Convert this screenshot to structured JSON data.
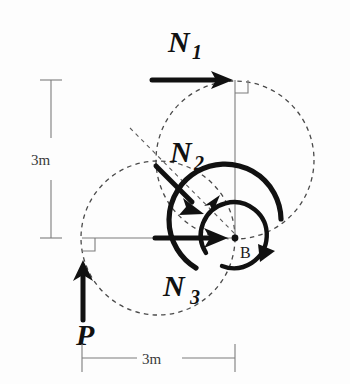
{
  "diagram": {
    "point_labels": {
      "b": "B"
    },
    "force_labels": {
      "n1": {
        "base": "N",
        "sub": "1"
      },
      "n2": {
        "base": "N",
        "sub": "2"
      },
      "n3": {
        "base": "N",
        "sub": "3"
      },
      "p": {
        "base": "P",
        "sub": ""
      }
    },
    "dimensions": {
      "vertical": {
        "value": "3m",
        "from_y": 80,
        "to_y": 238
      },
      "horizontal": {
        "value": "3m",
        "from_x": 82,
        "to_x": 235
      }
    },
    "geometry": {
      "point_b": {
        "x": 235,
        "y": 238
      },
      "corner_top": {
        "x": 235,
        "y": 80
      },
      "corner_left": {
        "x": 82,
        "y": 238
      },
      "right_angle_markers": 2,
      "dashed_circles": [
        {
          "cx": 235,
          "cy": 160,
          "r": 79
        },
        {
          "cx": 158,
          "cy": 238,
          "r": 77
        }
      ]
    },
    "colors": {
      "ink": "#111111",
      "dashed": "#4a4a4a",
      "thin_line": "#7d7d7d",
      "dim_text": "#3a3a3a",
      "background": "#fdfdfd"
    },
    "arrows": {
      "n1": {
        "direction": "right",
        "x1": 152,
        "y1": 80,
        "x2": 228,
        "y2": 80
      },
      "n2": {
        "direction": "down-right",
        "x1": 158,
        "y1": 168,
        "x2": 200,
        "y2": 210
      },
      "n3": {
        "direction": "right",
        "x1": 155,
        "y1": 238,
        "x2": 228,
        "y2": 238
      },
      "p": {
        "direction": "up",
        "x1": 82,
        "y1": 322,
        "x2": 82,
        "y2": 262
      }
    },
    "moment_arcs": {
      "inner": {
        "sense": "clockwise",
        "r": 33
      },
      "outer": {
        "sense": "counterclockwise",
        "r": 56
      }
    }
  }
}
